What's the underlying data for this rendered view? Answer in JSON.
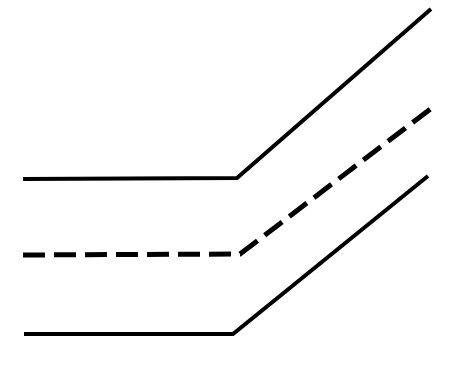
{
  "figure": {
    "title": "",
    "subtitle": "",
    "background_color": "#ffffff",
    "width": 456,
    "height": 367,
    "axes_visible": false,
    "grid_visible": false,
    "tick_labels_visible": false,
    "legend_visible": false,
    "annotations": []
  },
  "chart_data": {
    "type": "line",
    "title": "",
    "subtitle": "",
    "xlabel": "",
    "ylabel": "",
    "xlim": [
      0,
      456
    ],
    "ylim": [
      0,
      367
    ],
    "grid": false,
    "legend": false,
    "legend_position": "none",
    "axis_ranges_note": "Unlabeled schematic diagram; coordinates are in pixel space with y increasing downward.",
    "tick_labels": {
      "x": [],
      "y": []
    },
    "series": [
      {
        "name": "upper-solid-line",
        "style": "solid",
        "color": "#000000",
        "stroke_width": 4,
        "dash_pattern": "none",
        "points": [
          {
            "x": 23,
            "y": 179
          },
          {
            "x": 237,
            "y": 178
          },
          {
            "x": 431,
            "y": 9
          }
        ],
        "flat_value": 179,
        "kink_x": 237,
        "end_value": 9
      },
      {
        "name": "middle-dashed-line",
        "style": "dashed",
        "color": "#000000",
        "stroke_width": 5,
        "dash_pattern": "22 9",
        "points": [
          {
            "x": 23,
            "y": 255
          },
          {
            "x": 240,
            "y": 254
          },
          {
            "x": 433,
            "y": 107
          }
        ],
        "flat_value": 255,
        "kink_x": 240,
        "end_value": 107
      },
      {
        "name": "lower-solid-line",
        "style": "solid",
        "color": "#000000",
        "stroke_width": 4,
        "dash_pattern": "none",
        "points": [
          {
            "x": 24,
            "y": 334
          },
          {
            "x": 233,
            "y": 334
          },
          {
            "x": 428,
            "y": 176
          }
        ],
        "flat_value": 334,
        "kink_x": 233,
        "end_value": 176
      }
    ]
  }
}
